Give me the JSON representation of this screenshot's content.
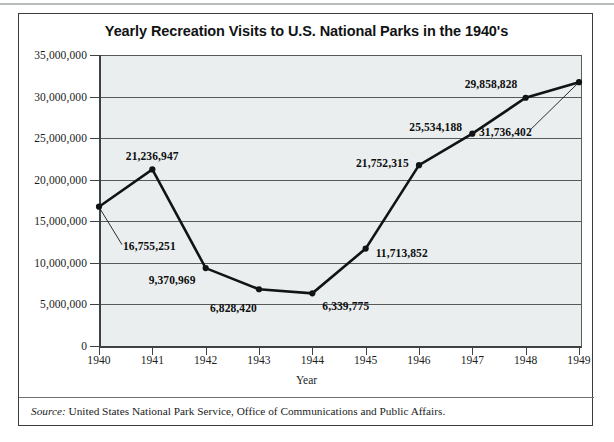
{
  "figure": {
    "title": "Yearly Recreation Visits to U.S. National Parks in the 1940's",
    "source_label": "Source:",
    "source_text": " United States National Park Service, Office of Communications and Public Affairs.",
    "plot_background": "#ebeeee",
    "line_color": "#111314",
    "frame_color": "#3a3d3d"
  },
  "chart_data": {
    "type": "line",
    "title": "Yearly Recreation Visits to U.S. National Parks in the 1940's",
    "xlabel": "Year",
    "ylabel": "",
    "categories": [
      "1940",
      "1941",
      "1942",
      "1943",
      "1944",
      "1945",
      "1946",
      "1947",
      "1948",
      "1949"
    ],
    "x": [
      1940,
      1941,
      1942,
      1943,
      1944,
      1945,
      1946,
      1947,
      1948,
      1949
    ],
    "values": [
      16755251,
      21236947,
      9370969,
      6828420,
      6339775,
      11713852,
      21752315,
      25534188,
      29858828,
      31736402
    ],
    "point_labels": [
      "16,755,251",
      "21,236,947",
      "9,370,969",
      "6,828,420",
      "6,339,775",
      "11,713,852",
      "21,752,315",
      "25,534,188",
      "29,858,828",
      "31,736,402"
    ],
    "ylim": [
      0,
      35000000
    ],
    "xlim": [
      1940,
      1949
    ],
    "ytick_values": [
      0,
      5000000,
      10000000,
      15000000,
      20000000,
      25000000,
      30000000,
      35000000
    ],
    "ytick_labels": [
      "0",
      "5,000,000",
      "10,000,000",
      "15,000,000",
      "20,000,000",
      "25,000,000",
      "30,000,000",
      "35,000,000"
    ],
    "xtick_labels": [
      "1940",
      "1941",
      "1942",
      "1943",
      "1944",
      "1945",
      "1946",
      "1947",
      "1948",
      "1949"
    ],
    "grid": "horizontal",
    "legend": "none",
    "markers": "filled-circle",
    "leader_lines": [
      "1940",
      "1949"
    ]
  }
}
